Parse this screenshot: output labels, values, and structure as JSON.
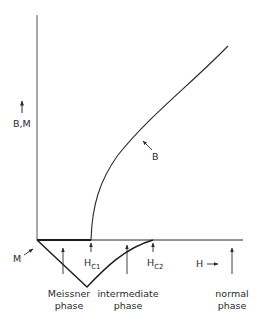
{
  "diagram": {
    "type": "superconductor magnetization vs field",
    "axes": {
      "y_label": "B,M",
      "x_label": "H"
    },
    "curves": {
      "B": "B",
      "M": "M"
    },
    "field_markers": {
      "hc1": {
        "main": "H",
        "sub": "C1"
      },
      "hc2": {
        "main": "H",
        "sub": "C2"
      }
    },
    "phases": [
      {
        "line1": "Meissner",
        "line2": "phase"
      },
      {
        "line1": "intermediate",
        "line2": "phase"
      },
      {
        "line1": "normal",
        "line2": "phase"
      }
    ],
    "colors": {
      "ink": "#2a2a2a",
      "background": "#ffffff"
    }
  }
}
